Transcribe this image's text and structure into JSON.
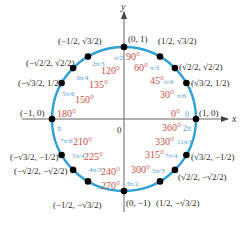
{
  "diagram": {
    "center_label": "0",
    "x_axis_label": "x",
    "y_axis_label": "y",
    "colors": {
      "circle": "#2f9fd8",
      "degree_text": "#c8504a",
      "radian_text": "#4a9ad0",
      "coordinate_text": "#2a2a2a",
      "axis": "#555555",
      "point": "#000000"
    },
    "points": [
      {
        "angle_deg": 0,
        "degree_label": "0°",
        "radian_label": "0",
        "coord": "(1, 0)"
      },
      {
        "angle_deg": 30,
        "degree_label": "30°",
        "radian_label": "π/6",
        "coord": "(√3/2, 1/2)"
      },
      {
        "angle_deg": 45,
        "degree_label": "45°",
        "radian_label": "π/4",
        "coord": "(√2/2, √2/2)"
      },
      {
        "angle_deg": 60,
        "degree_label": "60°",
        "radian_label": "π/3",
        "coord": "(1/2, √3/2)"
      },
      {
        "angle_deg": 90,
        "degree_label": "90°",
        "radian_label": "π/2",
        "coord": "(0, 1)"
      },
      {
        "angle_deg": 120,
        "degree_label": "120°",
        "radian_label": "2π/3",
        "coord": "(−1/2, √3/2)"
      },
      {
        "angle_deg": 135,
        "degree_label": "135°",
        "radian_label": "3π/4",
        "coord": "(−√2/2, √2/2)"
      },
      {
        "angle_deg": 150,
        "degree_label": "150°",
        "radian_label": "5π/6",
        "coord": "(−√3/2, 1/2)"
      },
      {
        "angle_deg": 180,
        "degree_label": "180°",
        "radian_label": "π",
        "coord": "(−1, 0)"
      },
      {
        "angle_deg": 210,
        "degree_label": "210°",
        "radian_label": "7π/6",
        "coord": "(−√3/2, −1/2)"
      },
      {
        "angle_deg": 225,
        "degree_label": "225°",
        "radian_label": "5π/4",
        "coord": "(−√2/2, −√2/2)"
      },
      {
        "angle_deg": 240,
        "degree_label": "240°",
        "radian_label": "4π/3",
        "coord": "(−1/2, −√3/2)"
      },
      {
        "angle_deg": 270,
        "degree_label": "270°",
        "radian_label": "3π/2",
        "coord": "(0, −1)"
      },
      {
        "angle_deg": 300,
        "degree_label": "300°",
        "radian_label": "5π/3",
        "coord": "(1/2, −√3/2)"
      },
      {
        "angle_deg": 315,
        "degree_label": "315°",
        "radian_label": "7π/4",
        "coord": "(√2/2, −√2/2)"
      },
      {
        "angle_deg": 330,
        "degree_label": "330°",
        "radian_label": "11π/6",
        "coord": "(√3/2, −1/2)"
      },
      {
        "angle_deg": 360,
        "degree_label": "360°",
        "radian_label": "2π",
        "coord": "(1, 0)"
      }
    ]
  }
}
